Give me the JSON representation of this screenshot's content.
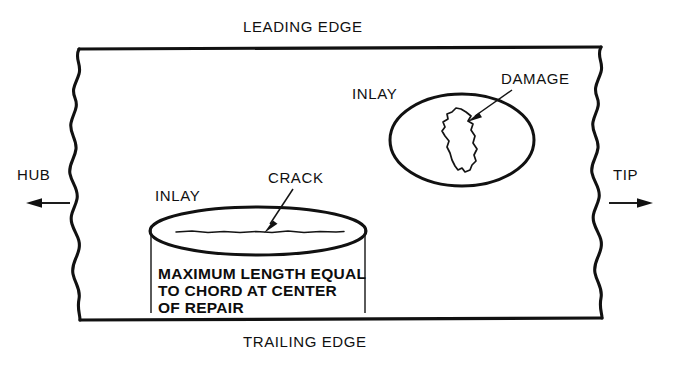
{
  "diagram": {
    "edges": {
      "leading_edge_label": "LEADING EDGE",
      "trailing_edge_label": "TRAILING EDGE",
      "hub_label": "HUB",
      "tip_label": "TIP"
    },
    "upper_repair": {
      "inlay_label": "INLAY",
      "defect_label": "DAMAGE",
      "inlay_shape": "ellipse",
      "defect_shape": "irregular-blob"
    },
    "lower_repair": {
      "inlay_label": "INLAY",
      "defect_label": "CRACK",
      "inlay_shape": "ellipse",
      "defect_shape": "horizontal-line",
      "dimension_note_lines": [
        "MAXIMUM LENGTH EQUAL",
        "TO CHORD AT CENTER",
        "OF REPAIR"
      ]
    },
    "icons": {
      "hub_arrow": "arrow-left-icon",
      "tip_arrow": "arrow-right-icon",
      "damage_leader": "leader-arrow-icon",
      "crack_leader": "leader-arrow-icon"
    },
    "colors": {
      "ink": "#111111",
      "background": "#ffffff"
    }
  }
}
